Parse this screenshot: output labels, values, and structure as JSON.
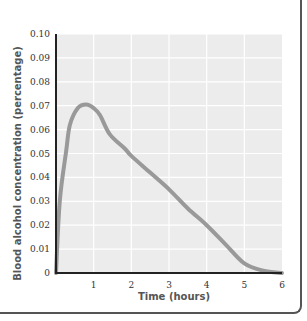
{
  "chart_data": {
    "type": "line",
    "title": "",
    "xlabel": "Time (hours)",
    "ylabel": "Blood alcohol concentration (percentage)",
    "xlim": [
      0,
      6
    ],
    "ylim": [
      0,
      0.1
    ],
    "x_ticks": [
      "1",
      "2",
      "3",
      "4",
      "5",
      "6"
    ],
    "y_ticks": [
      "0",
      "0.01",
      "0.02",
      "0.03",
      "0.04",
      "0.05",
      "0.06",
      "0.07",
      "0.08",
      "0.09",
      "0.10"
    ],
    "grid": true,
    "legend": null,
    "series": [
      {
        "name": "Blood alcohol concentration",
        "x": [
          0,
          0.1,
          0.27,
          0.37,
          0.58,
          0.8,
          1.0,
          1.17,
          1.43,
          1.83,
          2.0,
          2.5,
          3.0,
          3.5,
          4.0,
          4.5,
          5.0,
          5.5,
          6.0
        ],
        "y": [
          0,
          0.03,
          0.051,
          0.062,
          0.069,
          0.0705,
          0.069,
          0.066,
          0.058,
          0.052,
          0.049,
          0.042,
          0.035,
          0.027,
          0.02,
          0.012,
          0.004,
          0.001,
          0
        ]
      }
    ]
  },
  "colors": {
    "plot_background": "#ececec",
    "grid": "#ffffff",
    "line": "#999999",
    "axis": "#222222"
  }
}
